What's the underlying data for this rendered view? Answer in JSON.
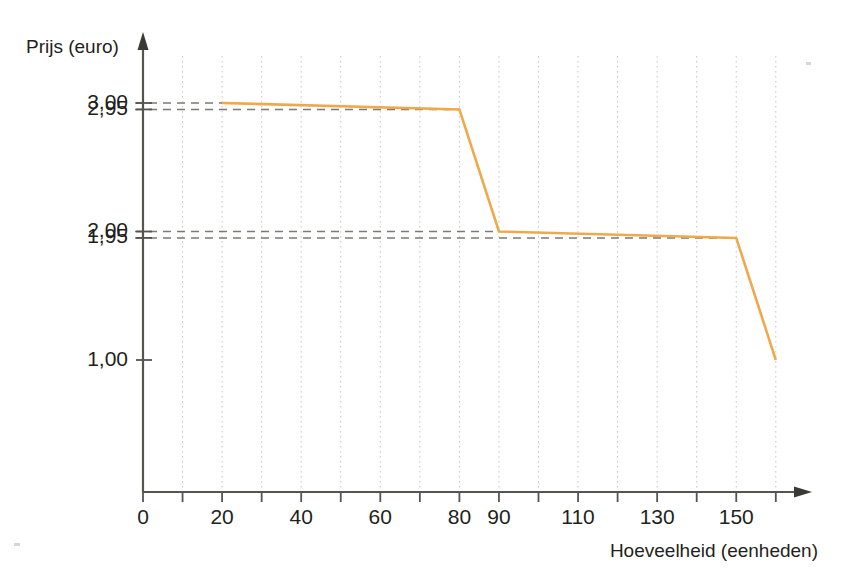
{
  "chart_data": {
    "type": "line",
    "title": "",
    "xlabel": "Hoeveelheid (eenheden)",
    "ylabel": "Prijs (euro)",
    "xlim": [
      0,
      170
    ],
    "ylim": [
      0,
      3.25
    ],
    "grid": true,
    "legend": null,
    "line_color": "#efa94a",
    "x_ticks_major": [
      0,
      10,
      20,
      30,
      40,
      50,
      60,
      70,
      80,
      90,
      100,
      110,
      120,
      130,
      140,
      150,
      160
    ],
    "x_tick_labels": [
      {
        "value": 0,
        "text": "0"
      },
      {
        "value": 20,
        "text": "20"
      },
      {
        "value": 40,
        "text": "40"
      },
      {
        "value": 60,
        "text": "60"
      },
      {
        "value": 80,
        "text": "80"
      },
      {
        "value": 90,
        "text": "90"
      },
      {
        "value": 110,
        "text": "110"
      },
      {
        "value": 130,
        "text": "130"
      },
      {
        "value": 150,
        "text": "150"
      }
    ],
    "y_tick_labels": [
      {
        "value": 3.0,
        "text": "3,00"
      },
      {
        "value": 2.95,
        "text": "2,95"
      },
      {
        "value": 2.0,
        "text": "2,00"
      },
      {
        "value": 1.95,
        "text": "1,95"
      },
      {
        "value": 1.0,
        "text": "1,00"
      }
    ],
    "gridlines_x": [
      10,
      20,
      30,
      40,
      50,
      60,
      70,
      80,
      90,
      100,
      110,
      120,
      130,
      140,
      150,
      160
    ],
    "reference_lines": [
      {
        "y": 3.0,
        "label": "3,00",
        "x_from": 0,
        "x_to": 20
      },
      {
        "y": 2.95,
        "label": "2,95",
        "x_from": 0,
        "x_to": 80
      },
      {
        "y": 2.0,
        "label": "2,00",
        "x_from": 0,
        "x_to": 90
      },
      {
        "y": 1.95,
        "label": "1,95",
        "x_from": 0,
        "x_to": 150
      }
    ],
    "series": [
      {
        "name": "Prijs",
        "color": "#efa94a",
        "points": [
          {
            "x": 20,
            "y": 3.0
          },
          {
            "x": 80,
            "y": 2.95
          },
          {
            "x": 90,
            "y": 2.0
          },
          {
            "x": 150,
            "y": 1.95
          },
          {
            "x": 160,
            "y": 1.0
          }
        ]
      }
    ]
  },
  "axis": {
    "y_title": "Prijs (euro)",
    "x_title": "Hoeveelheid (eenheden)"
  }
}
